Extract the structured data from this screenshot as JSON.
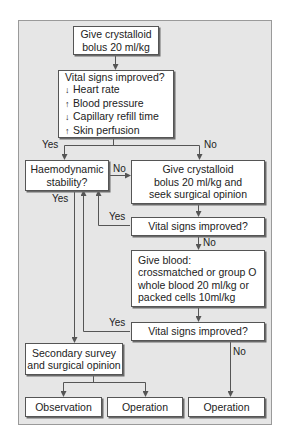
{
  "flowchart": {
    "nodes": {
      "start": {
        "lines": [
          "Give crystalloid",
          "bolus 20 ml/kg"
        ]
      },
      "vital_signs_1": {
        "title": "Vital signs improved?",
        "criteria": [
          {
            "arrow": "↓",
            "label": "Heart rate"
          },
          {
            "arrow": "↑",
            "label": "Blood pressure"
          },
          {
            "arrow": "↓",
            "label": "Capillary refill time"
          },
          {
            "arrow": "↑",
            "label": "Skin perfusion"
          }
        ]
      },
      "haemodynamic": {
        "lines": [
          "Haemodynamic",
          "stability?"
        ]
      },
      "second_bolus": {
        "lines": [
          "Give crystalloid",
          "bolus 20 ml/kg and",
          "seek surgical opinion"
        ]
      },
      "vital_signs_2": {
        "lines": [
          "Vital signs improved?"
        ]
      },
      "give_blood": {
        "lines": [
          "Give blood:",
          "crossmatched or group O",
          "whole blood 20 ml/kg or",
          "packed cells 10ml/kg"
        ]
      },
      "vital_signs_3": {
        "lines": [
          "Vital signs improved?"
        ]
      },
      "secondary_survey": {
        "lines": [
          "Secondary survey",
          "and surgical opinion"
        ]
      },
      "observation": {
        "lines": [
          "Observation"
        ]
      },
      "operation_1": {
        "lines": [
          "Operation"
        ]
      },
      "operation_2": {
        "lines": [
          "Operation"
        ]
      }
    },
    "edge_labels": {
      "vs1_yes": "Yes",
      "vs1_no": "No",
      "haemo_no": "No",
      "haemo_yes": "Yes",
      "vs2_yes": "Yes",
      "vs2_no": "No",
      "vs3_yes": "Yes",
      "vs3_no": "No"
    },
    "colors": {
      "panel_background": "#e6e6e6",
      "box_fill": "#ffffff",
      "line": "#555555"
    }
  }
}
